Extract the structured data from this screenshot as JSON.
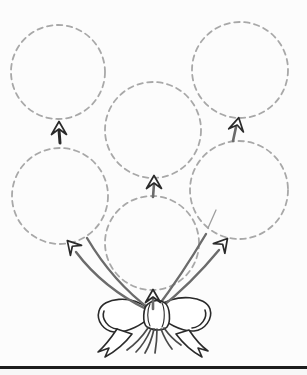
{
  "page": {
    "title": "Balloon bunch tracing worksheet",
    "width": 307,
    "height": 375,
    "background": "#fcfcfc"
  },
  "colors": {
    "balloon_outline": "#a8a8a8",
    "string": "#6b6b6b",
    "ink": "#2a2a2a",
    "knot_fill": "#ffffff",
    "faint_string": "#9e9e9e",
    "string_end": "#4a4a4a",
    "bottom_rule": "#1d1d1d",
    "below_rule": "#f7f7f7"
  },
  "dash_pattern": "5.5,4.5",
  "balloons": [
    {
      "name": "balloon-top-left",
      "cx": 58,
      "cy": 72,
      "r": 47,
      "knot": {
        "x": 59,
        "y": 130,
        "rotation": 0
      },
      "stem": {
        "x1": 59,
        "y1": 130,
        "x2": 60,
        "y2": 143,
        "color_key": "ink",
        "width": 3
      }
    },
    {
      "name": "balloon-top-middle",
      "cx": 153,
      "cy": 130,
      "r": 48,
      "knot": {
        "x": 154,
        "y": 184,
        "rotation": 0
      },
      "stem": {
        "x1": 154,
        "y1": 184,
        "x2": 153,
        "y2": 197,
        "color_key": "string",
        "width": 2.6
      }
    },
    {
      "name": "balloon-top-right",
      "cx": 240,
      "cy": 70,
      "r": 48,
      "knot": {
        "x": 237,
        "y": 126,
        "rotation": 12
      },
      "stem": {
        "x1": 236,
        "y1": 127,
        "x2": 233,
        "y2": 141,
        "color_key": "string",
        "width": 2.6
      }
    },
    {
      "name": "balloon-bottom-left",
      "cx": 60,
      "cy": 196,
      "r": 48,
      "knot": {
        "x": 73,
        "y": 247,
        "rotation": -42
      },
      "stem": null
    },
    {
      "name": "balloon-bottom-middle",
      "cx": 152,
      "cy": 243,
      "r": 47,
      "knot": {
        "x": 153,
        "y": 298,
        "rotation": 0
      },
      "stem": {
        "x1": 153,
        "y1": 299,
        "x2": 153,
        "y2": 309,
        "color_key": "string",
        "width": 2.6
      }
    },
    {
      "name": "balloon-bottom-right",
      "cx": 239,
      "cy": 190,
      "r": 49,
      "knot": {
        "x": 222,
        "y": 245,
        "rotation": 40
      },
      "stem": null
    }
  ],
  "knot_shape": "M 0,-8.5 L 7.5,4.5 L 0,-1 L -7.5,4.5 Z",
  "strings": [
    {
      "name": "string-left-outer",
      "d": "M 76,252 Q 103,288 148,310",
      "faint": false
    },
    {
      "name": "string-left-inner",
      "d": "M 87,238 Q 113,282 151,310",
      "faint": false
    },
    {
      "name": "string-right-outer",
      "d": "M 219,250 Q 191,284 158,310",
      "faint": false
    },
    {
      "name": "string-right-inner",
      "d": "M 206,234 Q 181,276 156,309",
      "faint": false
    },
    {
      "name": "string-right-faint",
      "d": "M 208,228 L 216,210",
      "faint": true
    }
  ],
  "bow": {
    "loops": [
      {
        "name": "bow-left-loop",
        "d": "M 147,308 C 132,295 103,297 99,311 C 96,321 104,331 114,332 C 128,333 143,324 150,317 Z"
      },
      {
        "name": "bow-right-loop",
        "d": "M 159,306 C 177,293 206,296 210,309 C 213,319 205,330 194,331 C 181,332 165,322 158,315 Z"
      }
    ],
    "folds": [
      {
        "name": "bow-left-loop-fold",
        "d": "M 104,311 C 101,319 108,328 117,329"
      },
      {
        "name": "bow-right-loop-fold",
        "d": "M 205,310 C 208,318 201,327 192,328"
      }
    ],
    "tails": [
      {
        "name": "bow-left-tail",
        "d": "M 117,329 C 111,338 105,346 98,352 L 109,348 L 105,357 C 116,351 126,342 132,334 Z"
      },
      {
        "name": "bow-right-tail",
        "d": "M 189,330 C 195,339 201,346 208,351 L 198,348 L 202,357 C 191,351 182,342 176,334 Z"
      }
    ],
    "knot_wrap": {
      "name": "bow-knot-wrap",
      "d": "M 148,304 C 143,307 142,323 147,327 C 153,331 163,331 167,327 C 171,322 170,307 165,303 C 159,299 153,300 148,304 Z"
    },
    "wrap_lines": [
      {
        "name": "bow-knot-wrap-line",
        "d": "M 150,304 C 147,310 147,320 150,326"
      },
      {
        "name": "bow-knot-wrap-line",
        "d": "M 162,303 C 165,309 165,321 162,327"
      }
    ],
    "string_ends": [
      {
        "name": "bow-string-end",
        "d": "M 148,328 C 142,337 134,345 127,350"
      },
      {
        "name": "bow-string-end",
        "d": "M 151,329 C 147,338 141,347 136,352"
      },
      {
        "name": "bow-string-end",
        "d": "M 154,329 C 152,338 148,348 145,353"
      },
      {
        "name": "bow-string-end",
        "d": "M 157,329 C 157,338 156,347 155,353"
      },
      {
        "name": "bow-string-end",
        "d": "M 161,329 C 164,337 168,344 172,349"
      },
      {
        "name": "bow-string-end",
        "d": "M 164,328 C 169,335 175,341 181,345"
      }
    ]
  },
  "bottom_rule": {
    "x": 0,
    "y": 366,
    "width": 307,
    "height": 3
  }
}
